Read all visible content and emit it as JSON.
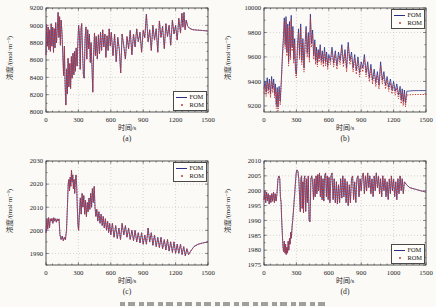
{
  "figure": {
    "background": "#fbfaf7",
    "caption_cropped_at_bottom": true
  },
  "chart_data": [
    {
      "type": "line",
      "sublabel": "(a)",
      "xlabel": "时间/s",
      "ylabel": "浓度/(mol·m⁻³)",
      "xlim": [
        0,
        1500
      ],
      "ylim": [
        8000,
        9200
      ],
      "xticks": [
        0,
        300,
        600,
        900,
        1200,
        1500
      ],
      "xtick_labels": [
        "0",
        "300",
        "600",
        "900",
        "1200",
        "1500"
      ],
      "yticks": [
        8000,
        8200,
        8400,
        8600,
        8800,
        9000,
        9200
      ],
      "grid": "dotted",
      "legend": {
        "position": "bottom-right",
        "items": [
          {
            "label": "FOM",
            "marker": "line",
            "color": "#2b2e86"
          },
          {
            "label": "ROM",
            "marker": "dot",
            "color": "#c03a3a"
          }
        ]
      },
      "rom_offset": 0,
      "points_t_v": [
        0,
        8660,
        6,
        9010,
        13,
        8760,
        20,
        8980,
        27,
        8720,
        34,
        8950,
        41,
        8700,
        48,
        9020,
        55,
        8760,
        62,
        8980,
        69,
        8690,
        76,
        8960,
        83,
        8740,
        90,
        9030,
        97,
        8800,
        104,
        8920,
        112,
        9150,
        119,
        8860,
        126,
        9100,
        133,
        8770,
        140,
        9060,
        148,
        8910,
        156,
        8660,
        163,
        8420,
        170,
        8760,
        177,
        8310,
        184,
        8080,
        191,
        8500,
        198,
        8210,
        205,
        8620,
        212,
        8290,
        220,
        8560,
        228,
        8270,
        235,
        8640,
        242,
        8390,
        250,
        8680,
        258,
        8430,
        265,
        8700,
        272,
        8470,
        280,
        8740,
        288,
        8530,
        295,
        8810,
        302,
        9000,
        310,
        8880,
        317,
        8490,
        324,
        8960,
        331,
        9020,
        338,
        8710,
        346,
        8430,
        354,
        8390,
        362,
        8860,
        370,
        8980,
        378,
        8610,
        386,
        8950,
        394,
        8730,
        402,
        8900,
        410,
        8570,
        418,
        8800,
        426,
        8510,
        433,
        8230,
        441,
        8660,
        449,
        8910,
        457,
        8650,
        465,
        8870,
        475,
        8610,
        485,
        8890,
        495,
        8670,
        505,
        8920,
        515,
        8710,
        525,
        8950,
        535,
        8750,
        545,
        8900,
        555,
        8630,
        565,
        8880,
        575,
        8710,
        585,
        8960,
        595,
        8760,
        605,
        8920,
        620,
        8650,
        635,
        8900,
        650,
        8580,
        665,
        8860,
        680,
        8710,
        692,
        8450,
        705,
        8900,
        720,
        8760,
        735,
        8610,
        750,
        8870,
        765,
        8730,
        780,
        8940,
        795,
        8660,
        810,
        8900,
        825,
        8750,
        840,
        8960,
        855,
        8810,
        870,
        8920,
        885,
        8690,
        900,
        8940,
        915,
        8860,
        930,
        9130,
        945,
        8810,
        960,
        8950,
        975,
        8710,
        990,
        9000,
        1005,
        8830,
        1020,
        8960,
        1035,
        8690,
        1050,
        9050,
        1065,
        8860,
        1080,
        8990,
        1095,
        8730,
        1110,
        9020,
        1125,
        8870,
        1140,
        9000,
        1155,
        8770,
        1170,
        9060,
        1185,
        8900,
        1200,
        9000,
        1215,
        8830,
        1230,
        9080,
        1245,
        8910,
        1258,
        9140,
        1268,
        8980,
        1278,
        9150,
        1288,
        8950,
        1298,
        9060,
        1312,
        8990,
        1330,
        8965,
        1360,
        8950,
        1400,
        8945,
        1450,
        8940,
        1500,
        8935
      ]
    },
    {
      "type": "line",
      "sublabel": "(b)",
      "xlabel": "时间/s",
      "ylabel": "浓度/(mol·m⁻³)",
      "xlim": [
        0,
        1500
      ],
      "ylim": [
        9150,
        10000
      ],
      "xticks": [
        0,
        300,
        600,
        900,
        1200,
        1500
      ],
      "xtick_labels": [
        "0",
        "300",
        "600",
        "900",
        "1200",
        "1500"
      ],
      "yticks": [
        9200,
        9400,
        9600,
        9800,
        10000
      ],
      "grid": "dotted",
      "legend": {
        "position": "top-right",
        "items": [
          {
            "label": "FOM",
            "marker": "line",
            "color": "#2b2e86"
          },
          {
            "label": "ROM",
            "marker": "dot",
            "color": "#c03a3a"
          }
        ]
      },
      "rom_offset": -32,
      "points_t_v": [
        0,
        9340,
        10,
        9400,
        20,
        9310,
        30,
        9430,
        40,
        9330,
        50,
        9420,
        60,
        9300,
        70,
        9440,
        80,
        9340,
        90,
        9420,
        98,
        9300,
        106,
        9380,
        114,
        9210,
        122,
        9350,
        130,
        9190,
        140,
        9360,
        150,
        9240,
        160,
        9410,
        170,
        9610,
        180,
        9760,
        188,
        9920,
        196,
        9700,
        204,
        9930,
        212,
        9640,
        220,
        9870,
        228,
        9560,
        236,
        9890,
        244,
        9610,
        252,
        9940,
        260,
        9680,
        268,
        9850,
        276,
        9580,
        284,
        9750,
        292,
        9490,
        300,
        9460,
        310,
        9700,
        320,
        9830,
        330,
        9610,
        340,
        9870,
        350,
        9570,
        360,
        9750,
        370,
        9510,
        380,
        9700,
        390,
        9850,
        400,
        9630,
        410,
        9800,
        420,
        9590,
        430,
        9950,
        440,
        9710,
        450,
        9820,
        460,
        9610,
        470,
        9740,
        478,
        9570,
        486,
        9680,
        494,
        9550,
        502,
        9660,
        510,
        9590,
        520,
        9700,
        530,
        9570,
        540,
        9650,
        550,
        9550,
        560,
        9680,
        570,
        9560,
        580,
        9640,
        590,
        9530,
        600,
        9620,
        615,
        9570,
        630,
        9680,
        645,
        9550,
        660,
        9650,
        675,
        9530,
        690,
        9640,
        705,
        9570,
        720,
        9700,
        735,
        9550,
        750,
        9660,
        765,
        9510,
        780,
        9720,
        795,
        9570,
        810,
        9640,
        825,
        9510,
        840,
        9620,
        855,
        9490,
        870,
        9600,
        885,
        9470,
        900,
        9560,
        915,
        9510,
        930,
        9620,
        945,
        9470,
        960,
        9560,
        975,
        9430,
        990,
        9540,
        1005,
        9410,
        1020,
        9500,
        1035,
        9390,
        1050,
        9480,
        1065,
        9370,
        1080,
        9560,
        1095,
        9410,
        1110,
        9480,
        1125,
        9370,
        1140,
        9440,
        1155,
        9350,
        1170,
        9420,
        1185,
        9330,
        1200,
        9400,
        1215,
        9320,
        1230,
        9380,
        1245,
        9290,
        1260,
        9360,
        1270,
        9250,
        1280,
        9340,
        1290,
        9235,
        1300,
        9330,
        1310,
        9225,
        1322,
        9320,
        1345,
        9322,
        1380,
        9324,
        1430,
        9325,
        1500,
        9325
      ]
    },
    {
      "type": "line",
      "sublabel": "(c)",
      "xlabel": "时间/s",
      "ylabel": "浓度/(mol·m⁻³)",
      "xlim": [
        0,
        1500
      ],
      "ylim": [
        1985,
        2030
      ],
      "xticks": [
        0,
        300,
        600,
        900,
        1200,
        1500
      ],
      "xtick_labels": [
        "0",
        "300",
        "600",
        "900",
        "1200",
        "1500"
      ],
      "yticks": [
        1990,
        2000,
        2010,
        2020,
        2030
      ],
      "grid": "dotted",
      "legend": {
        "position": "top-right",
        "items": [
          {
            "label": "FOM",
            "marker": "line",
            "color": "#2b2e86"
          },
          {
            "label": "ROM",
            "marker": "dot",
            "color": "#c03a3a"
          }
        ]
      },
      "rom_offset": 0,
      "points_t_v": [
        0,
        1999,
        8,
        2005,
        16,
        2000.5,
        24,
        2005.5,
        32,
        2001,
        40,
        2005,
        48,
        2004,
        56,
        2005.2,
        64,
        2003,
        72,
        2005.5,
        80,
        2004,
        88,
        2005,
        96,
        2003.5,
        104,
        2005,
        112,
        2004,
        120,
        2005,
        130,
        1998,
        140,
        1996,
        150,
        1997.5,
        160,
        1995.5,
        170,
        1997,
        180,
        1996,
        190,
        2000,
        198,
        2010,
        206,
        2020,
        212,
        2022,
        218,
        2017,
        224,
        2023,
        230,
        2019,
        236,
        2026,
        242,
        2021,
        248,
        2024,
        254,
        2018,
        260,
        2022,
        266,
        2016,
        272,
        2021,
        278,
        2024,
        284,
        2019,
        290,
        2010,
        296,
        2002,
        302,
        2000,
        310,
        2008,
        318,
        2014,
        326,
        2007,
        334,
        2016,
        342,
        2010,
        350,
        2015,
        358,
        2007,
        366,
        2013,
        374,
        2006,
        382,
        2012,
        390,
        2008,
        398,
        2014,
        406,
        2009,
        414,
        2016,
        422,
        2010,
        430,
        2018,
        438,
        2012,
        446,
        2019,
        454,
        2010,
        462,
        2006,
        470,
        2009,
        480,
        2004,
        490,
        2008,
        500,
        2003,
        510,
        2007,
        520,
        2002,
        530,
        2006,
        540,
        2001,
        550,
        2005,
        560,
        2000,
        570,
        2004,
        580,
        1999,
        590,
        2003,
        600,
        1998,
        615,
        2003,
        630,
        1997,
        645,
        2002,
        660,
        1996.5,
        675,
        2001,
        690,
        1996,
        705,
        2003,
        720,
        1998,
        735,
        2002,
        750,
        1997,
        765,
        2001,
        780,
        1996,
        795,
        2000,
        810,
        1995.5,
        825,
        2000,
        840,
        1995,
        855,
        1999,
        870,
        1994.5,
        885,
        1999,
        900,
        1994,
        915,
        1998,
        930,
        1994,
        945,
        2001,
        960,
        1995,
        975,
        1999,
        990,
        1993.5,
        1005,
        1998,
        1020,
        1993,
        1035,
        1997,
        1050,
        1992.5,
        1065,
        1997,
        1080,
        1992,
        1095,
        1996,
        1110,
        1991.5,
        1125,
        1996,
        1140,
        1991,
        1155,
        1995,
        1170,
        1990.5,
        1185,
        1995,
        1200,
        1990,
        1215,
        1994,
        1230,
        1990,
        1245,
        1994,
        1260,
        1989.5,
        1275,
        1993,
        1290,
        1989,
        1305,
        1992,
        1320,
        1989.5,
        1340,
        1991,
        1370,
        1993,
        1410,
        1994,
        1450,
        1994.5,
        1500,
        1995
      ]
    },
    {
      "type": "line",
      "sublabel": "(d)",
      "xlabel": "时间/s",
      "ylabel": "浓度/(mol·m⁻³)",
      "xlim": [
        0,
        1500
      ],
      "ylim": [
        1975,
        2010
      ],
      "xticks": [
        0,
        300,
        600,
        900,
        1200,
        1500
      ],
      "xtick_labels": [
        "0",
        "300",
        "600",
        "900",
        "1000",
        "1500"
      ],
      "yticks": [
        1975,
        1980,
        1985,
        1990,
        1995,
        2000,
        2005,
        2010
      ],
      "grid": "dotted",
      "legend": {
        "position": "bottom-right",
        "items": [
          {
            "label": "FOM",
            "marker": "line",
            "color": "#2b2e86"
          },
          {
            "label": "ROM",
            "marker": "dot",
            "color": "#c03a3a"
          }
        ]
      },
      "rom_offset": 0,
      "points_t_v": [
        0,
        1997,
        8,
        2000,
        16,
        1996,
        24,
        1999.5,
        32,
        1996.5,
        40,
        1999,
        48,
        1995.5,
        56,
        1998.5,
        64,
        1996,
        72,
        1999,
        80,
        1996.5,
        88,
        1999.5,
        96,
        1996,
        104,
        1999,
        112,
        1996.5,
        120,
        1999,
        130,
        2004,
        138,
        2005,
        146,
        2004,
        152,
        1998,
        158,
        1996,
        164,
        1990,
        170,
        1985,
        176,
        1981,
        182,
        1979.5,
        188,
        1983,
        194,
        1979,
        200,
        1982,
        206,
        1978.5,
        212,
        1981,
        218,
        1979,
        224,
        1983,
        230,
        1980,
        236,
        1984,
        242,
        1982,
        248,
        1986,
        254,
        1984,
        260,
        1988,
        266,
        1990,
        272,
        1993,
        278,
        1996,
        284,
        1999,
        290,
        2002,
        298,
        2006,
        306,
        2007,
        314,
        2006.5,
        322,
        2004,
        330,
        1998,
        336,
        1993,
        342,
        2004,
        348,
        2005,
        354,
        1994,
        360,
        2003,
        366,
        1992.5,
        372,
        2004,
        378,
        2005,
        386,
        1993,
        394,
        2004,
        402,
        1996,
        410,
        2005,
        418,
        1990,
        426,
        1989.5,
        434,
        2004,
        442,
        2005,
        450,
        2003,
        458,
        1997,
        466,
        2004,
        474,
        1998,
        482,
        2005,
        490,
        1999,
        498,
        2005.5,
        506,
        2000,
        514,
        2006,
        522,
        1998,
        530,
        2005,
        538,
        1997,
        546,
        2004,
        554,
        1996.5,
        562,
        2005,
        570,
        2006,
        578,
        1998,
        586,
        2005,
        594,
        1997,
        602,
        2004.5,
        610,
        1996,
        620,
        2005,
        630,
        2006,
        640,
        1997,
        650,
        2004,
        660,
        1996,
        670,
        2003,
        680,
        1995.5,
        690,
        2002,
        700,
        1996,
        710,
        2004,
        720,
        1997.5,
        730,
        2005,
        740,
        1998,
        750,
        2004,
        760,
        1996,
        770,
        2003,
        780,
        1995,
        790,
        2002,
        800,
        1996,
        810,
        2004,
        820,
        2005,
        830,
        1997,
        840,
        2003,
        850,
        1996,
        860,
        2004,
        870,
        2005,
        880,
        1998,
        890,
        2004,
        900,
        2000,
        910,
        2005,
        920,
        2006,
        930,
        1999,
        940,
        2005,
        950,
        2000,
        960,
        2006,
        970,
        2001,
        980,
        2005,
        990,
        1999,
        1000,
        2004,
        1010,
        1998,
        1020,
        2005,
        1030,
        2000,
        1040,
        2006,
        1050,
        2001,
        1060,
        2005,
        1070,
        1999,
        1080,
        2004,
        1090,
        1998,
        1100,
        2005,
        1110,
        2000,
        1120,
        2004,
        1130,
        1998,
        1140,
        2003,
        1150,
        1997,
        1160,
        2004,
        1170,
        1999,
        1180,
        2005,
        1190,
        2000,
        1200,
        2004,
        1210,
        1998,
        1220,
        2003,
        1230,
        1997,
        1240,
        2004,
        1250,
        1999,
        1260,
        2005,
        1270,
        2000,
        1280,
        2004,
        1290,
        1999,
        1300,
        2003,
        1320,
        2002,
        1350,
        2001,
        1400,
        2000.5,
        1450,
        2000,
        1500,
        1999.5
      ]
    }
  ]
}
